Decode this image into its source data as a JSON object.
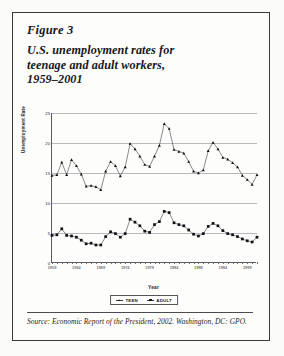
{
  "figure": {
    "number_label": "Figure 3",
    "title_lines": [
      "U.S. unemployment rates for",
      "teenage and adult workers,",
      "1959–2001"
    ],
    "source_line1": "Source: Economic Report of the President, 2002. Washington,",
    "source_line2": "DC: GPO."
  },
  "chart_data": {
    "type": "line",
    "title": "",
    "xlabel": "Year",
    "ylabel": "Unemployment Rate",
    "xlim": [
      1959,
      2001
    ],
    "ylim": [
      0,
      25
    ],
    "yticks": [
      0,
      5,
      10,
      15,
      20,
      25
    ],
    "xticks": [
      1959,
      1964,
      1969,
      1974,
      1979,
      1984,
      1989,
      1994,
      1999
    ],
    "grid": true,
    "legend_position": "bottom",
    "x": [
      1959,
      1960,
      1961,
      1962,
      1963,
      1964,
      1965,
      1966,
      1967,
      1968,
      1969,
      1970,
      1971,
      1972,
      1973,
      1974,
      1975,
      1976,
      1977,
      1978,
      1979,
      1980,
      1981,
      1982,
      1983,
      1984,
      1985,
      1986,
      1987,
      1988,
      1989,
      1990,
      1991,
      1992,
      1993,
      1994,
      1995,
      1996,
      1997,
      1998,
      1999,
      2000,
      2001
    ],
    "series": [
      {
        "name": "TEEN",
        "marker": "triangle",
        "values": [
          14.6,
          14.7,
          16.8,
          14.7,
          17.2,
          16.2,
          14.8,
          12.8,
          12.9,
          12.7,
          12.2,
          15.3,
          16.9,
          16.2,
          14.5,
          16.0,
          19.9,
          19.0,
          17.8,
          16.4,
          16.1,
          17.8,
          19.6,
          23.2,
          22.4,
          18.9,
          18.6,
          18.3,
          16.9,
          15.3,
          15.0,
          15.5,
          18.7,
          20.1,
          19.0,
          17.6,
          17.3,
          16.7,
          16.0,
          14.6,
          13.9,
          13.1,
          14.7
        ]
      },
      {
        "name": "ADULT",
        "marker": "square",
        "values": [
          4.6,
          4.7,
          5.7,
          4.6,
          4.5,
          4.3,
          3.8,
          3.2,
          3.3,
          3.0,
          3.0,
          4.4,
          5.2,
          4.9,
          4.3,
          4.9,
          7.3,
          6.8,
          6.2,
          5.3,
          5.1,
          6.4,
          6.9,
          8.6,
          8.4,
          6.7,
          6.4,
          6.2,
          5.5,
          4.8,
          4.5,
          4.9,
          6.1,
          6.6,
          6.2,
          5.4,
          4.9,
          4.7,
          4.4,
          4.0,
          3.7,
          3.5,
          4.3
        ]
      }
    ]
  },
  "legend": [
    {
      "label": "TEEN"
    },
    {
      "label": "ADULT"
    }
  ]
}
